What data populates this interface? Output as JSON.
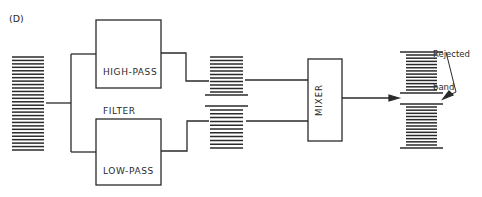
{
  "figure": {
    "label": "(D)"
  },
  "blocks": {
    "high_pass": {
      "line1": "HIGH-PASS",
      "line2": "FILTER"
    },
    "low_pass": {
      "line1": "LOW-PASS",
      "line2": "FILTER"
    },
    "mixer": {
      "label": "MIXER"
    }
  },
  "annotation": {
    "line1": "Rejected",
    "line2": "band"
  },
  "spectra": {
    "input": {
      "description": "full band input spectrum",
      "lines": 28
    },
    "filtered": {
      "description": "split band after filters",
      "upper_lines": 11,
      "lower_lines": 11
    },
    "output": {
      "description": "mixer output with rejected band",
      "upper_lines": 12,
      "lower_lines": 13
    }
  },
  "colors": {
    "ink": "#2a2a2a",
    "background": "#ffffff"
  }
}
